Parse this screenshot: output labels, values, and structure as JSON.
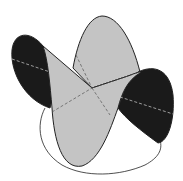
{
  "figure": {
    "colors": {
      "background": "#ffffff",
      "light_fill": "#c4c4c4",
      "dark_fill": "#1a1a1a",
      "outline": "#222222",
      "dashed_on_dark": "#bdbdbd",
      "dashed_on_light": "#555555"
    },
    "lobes": [
      {
        "name": "top-lobe",
        "shade": "light"
      },
      {
        "name": "left-lobe",
        "shade": "dark"
      },
      {
        "name": "right-lobe",
        "shade": "dark"
      },
      {
        "name": "front-lobe",
        "shade": "light"
      }
    ]
  }
}
